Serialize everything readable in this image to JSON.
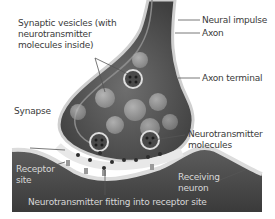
{
  "diagram": {
    "title": "Synapse",
    "colors": {
      "background": "#ffffff",
      "axon_fill": "#5a5a5a",
      "axon_wall": "#c9c9c9",
      "cleft": "#e6e6e6",
      "receiving_neuron": "#4e4e4e",
      "vesicle": "#a9a9a9",
      "molecule": "#2e2e2e",
      "label_dark": "#3a3a3a",
      "label_light": "#d8d8d8"
    },
    "labels": {
      "synaptic_vesicles": "Synaptic vesicles (with neurotransmitter molecules inside)",
      "neural_impulse": "Neural impulse",
      "axon": "Axon",
      "axon_terminal": "Axon terminal",
      "synapse": "Synapse",
      "neurotransmitter_molecules": "Neurotransmitter molecules",
      "receptor_site": "Receptor site",
      "receiving_neuron": "Receiving neuron",
      "fitting": "Neurotransmitter fitting into receptor site"
    }
  }
}
